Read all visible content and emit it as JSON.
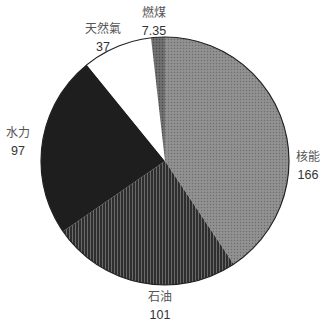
{
  "chart_data": {
    "type": "pie",
    "title": "",
    "start": "12-o'clock",
    "direction": "clockwise",
    "slices": [
      {
        "label": "核能",
        "value": 166,
        "value_text": "166",
        "fill": "#8c8c8c",
        "pattern": "dots"
      },
      {
        "label": "石油",
        "value": 101,
        "value_text": "101",
        "fill": "#3f3f3f",
        "pattern": "vertical-lines"
      },
      {
        "label": "水力",
        "value": 97,
        "value_text": "97",
        "fill": "#1e1e1e",
        "pattern": "solid"
      },
      {
        "label": "天然氣",
        "value": 37,
        "value_text": "37",
        "fill": "#ffffff",
        "pattern": "solid"
      },
      {
        "label": "燃煤",
        "value": 7.35,
        "value_text": "7.35",
        "fill": "#6a6a6a",
        "pattern": "dots"
      }
    ],
    "legend": "none",
    "data_labels": "outside"
  }
}
